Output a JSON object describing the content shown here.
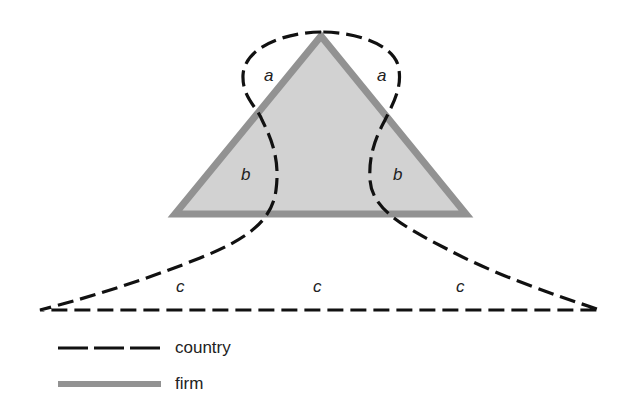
{
  "diagram": {
    "colors": {
      "firm_fill": "#d2d2d2",
      "firm_stroke": "#929292",
      "country_stroke": "#111111"
    },
    "regions": [
      {
        "id": "a-left",
        "label": "a",
        "x": 264,
        "y": 81
      },
      {
        "id": "a-right",
        "label": "a",
        "x": 378,
        "y": 81
      },
      {
        "id": "b-left",
        "label": "b",
        "x": 243,
        "y": 180
      },
      {
        "id": "b-right",
        "label": "b",
        "x": 396,
        "y": 180
      },
      {
        "id": "c-left",
        "label": "c",
        "x": 178,
        "y": 292
      },
      {
        "id": "c-center",
        "label": "c",
        "x": 316,
        "y": 292
      },
      {
        "id": "c-right",
        "label": "c",
        "x": 460,
        "y": 292
      }
    ]
  },
  "legend": {
    "country": {
      "label": "country",
      "style": "dashed"
    },
    "firm": {
      "label": "firm",
      "style": "solid-gray"
    }
  }
}
